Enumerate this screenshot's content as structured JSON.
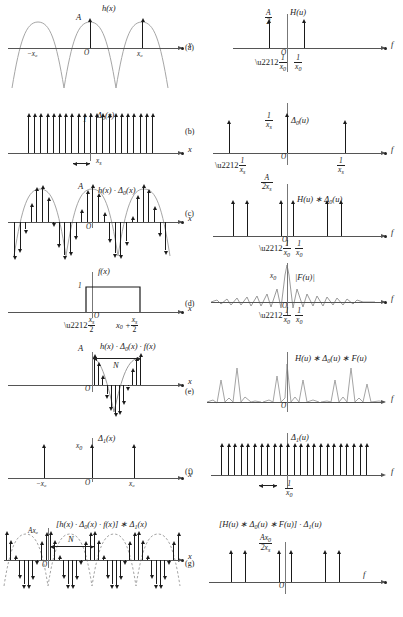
{
  "figure": {
    "panel_letters": [
      "(a)",
      "(b)",
      "(c)",
      "(d)",
      "(e)",
      "(f)",
      "(g)"
    ],
    "axis_labels": {
      "spatial": "x",
      "frequency": "f",
      "origin": "O"
    }
  },
  "panels": {
    "a": {
      "letter": "(a)",
      "left": {
        "signal_label": "h(x)",
        "amplitude_label": "A",
        "axis": "x",
        "origin": "O",
        "ticks": [
          "−x₀",
          "x₀"
        ],
        "description": "cosine of amplitude A and period x₀"
      },
      "right": {
        "signal_label": "H(u)",
        "amplitude_num": "A",
        "amplitude_den": "2",
        "axis": "f",
        "origin": "O",
        "ticks": [
          "−1/x₀",
          "1/x₀"
        ],
        "description": "two impulses of height A/2 at ±1/x₀"
      }
    },
    "b": {
      "letter": "(b)",
      "left": {
        "signal_label": "Δ0(x)",
        "amplitude_label": "1",
        "axis": "x",
        "origin": "O",
        "spacing_label": "xₛ",
        "description": "impulse comb of unit height, spacing xₛ"
      },
      "right": {
        "signal_label": "Δ0(u)",
        "amplitude_num": "1",
        "amplitude_den": "xₛ",
        "axis": "f",
        "origin": "O",
        "ticks": [
          "−1/xₛ",
          "1/xₛ"
        ],
        "description": "impulse comb of height 1/xₛ, spacing 1/xₛ"
      }
    },
    "c": {
      "letter": "(c)",
      "left": {
        "signal_label": "h(x) · Δ0(x)",
        "amplitude_label": "A",
        "axis": "x",
        "origin": "O",
        "description": "sampled cosine: impulses riding on the cosine envelope"
      },
      "right": {
        "signal_label": "H(u) ∗ Δ0(u)",
        "amplitude_num": "A",
        "amplitude_den": "2xₛ",
        "axis": "f",
        "origin": "O",
        "ticks": [
          "−1/x₀",
          "1/x₀"
        ],
        "description": "periodic replication of the impulse pair, height A/(2xₛ)"
      }
    },
    "d": {
      "letter": "(d)",
      "left": {
        "signal_label": "f(x)",
        "amplitude_label": "1",
        "axis": "x",
        "origin": "O",
        "tick_left_num": "xₛ",
        "tick_left_den": "2",
        "tick_left_sign": "−",
        "tick_right": "x₀ +",
        "tick_right_num": "xₛ",
        "tick_right_den": "2",
        "description": "unit rectangular window from −xₛ/2 to x₀ + xₛ/2"
      },
      "right": {
        "signal_label": "|F(u)|",
        "amplitude_label": "x₀",
        "axis": "f",
        "origin": "O",
        "ticks": [
          "−1/x₀",
          "1/x₀"
        ],
        "description": "sinc magnitude with peak x₀ and zeros at multiples of 1/x₀"
      }
    },
    "e": {
      "letter": "(e)",
      "left": {
        "signal_label": "h(x) · Δ0(x) · f(x)",
        "amplitude_label": "A",
        "axis": "x",
        "origin": "O",
        "count_label": "N",
        "description": "windowed sample set of N samples over one period"
      },
      "right": {
        "signal_label": "H(u) ∗ Δ0(u) ∗ F(u)",
        "axis": "f",
        "origin": "O",
        "description": "replicated spectra smeared by the sinc kernel"
      }
    },
    "f": {
      "letter": "(f)",
      "left": {
        "signal_label": "Δ1(x)",
        "amplitude_label": "x₀",
        "axis": "x",
        "origin": "O",
        "ticks": [
          "−x₀",
          "x₀"
        ],
        "description": "impulse comb of height x₀ and spacing x₀"
      },
      "right": {
        "signal_label": "Δ1(u)",
        "axis": "f",
        "origin": "O",
        "spacing_num": "1",
        "spacing_den": "x₀",
        "description": "impulse comb of unit height, spacing 1/x₀"
      }
    },
    "g": {
      "letter": "(g)",
      "left": {
        "signal_label": "[h(x) · Δ0(x) · f(x)] ∗ Δ1(x)",
        "amplitude_label": "Ax₀",
        "axis": "x",
        "origin": "O",
        "count_label": "N",
        "description": "periodic extension of the windowed samples, dashed cosine envelope"
      },
      "right": {
        "signal_label": "[H(u) ∗ Δ0(u) ∗ F(u)] · Δ1(u)",
        "amplitude_num": "Ax₀",
        "amplitude_den": "2xₛ",
        "axis": "f",
        "origin": "O",
        "description": "spectrum sampled by the comb, height Ax₀/(2xₛ)"
      }
    }
  },
  "colors": {
    "ink": "#1a1a1a",
    "axis": "#555555",
    "envelope": "#9a9a9a",
    "background": "#ffffff"
  }
}
